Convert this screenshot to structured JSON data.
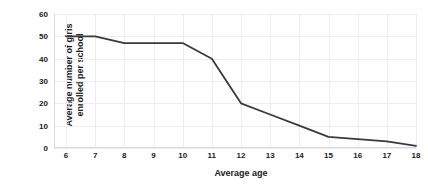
{
  "chart_data": {
    "type": "line",
    "title": "",
    "xlabel": "Average age",
    "ylabel": "Average number of girls enrolled per school",
    "ylabel_lines": [
      "Average number of girls",
      "enrolled per school"
    ],
    "x": [
      6,
      7,
      8,
      9,
      10,
      11,
      12,
      13,
      14,
      15,
      16,
      17,
      18
    ],
    "values": [
      50,
      50,
      47,
      47,
      47,
      40,
      20,
      15,
      10,
      5,
      4,
      3,
      1
    ],
    "xticklabels": [
      "6",
      "7",
      "8",
      "9",
      "10",
      "11",
      "12",
      "13",
      "14",
      "15",
      "16",
      "17",
      "18"
    ],
    "yticklabels": [
      "0",
      "10",
      "20",
      "30",
      "40",
      "50",
      "60"
    ],
    "yticks": [
      0,
      10,
      20,
      30,
      40,
      50,
      60
    ],
    "xlim": [
      6,
      18
    ],
    "ylim": [
      0,
      60
    ],
    "grid": true,
    "legend": "none",
    "series": [
      {
        "name": "Average number of girls enrolled per school",
        "values": [
          50,
          50,
          47,
          47,
          47,
          40,
          20,
          15,
          10,
          5,
          4,
          3,
          1
        ]
      }
    ],
    "colors": {
      "line": "#3a3a3a",
      "grid": "#ededed",
      "axis": "#d9d9d9",
      "text": "#1a1a1a",
      "background": "#ffffff"
    },
    "line_width": 1.8
  }
}
